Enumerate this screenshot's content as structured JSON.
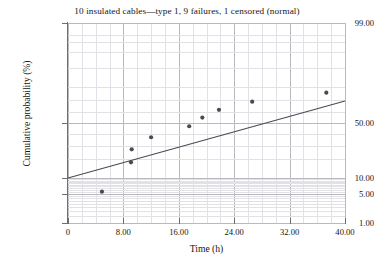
{
  "chart_data": {
    "type": "scatter",
    "title": "10 insulated cables—type 1, 9 failures, 1 censored (normal)",
    "xlabel": "Time (h)",
    "ylabel": "Cumulative probability (%)",
    "xlim": [
      0,
      40
    ],
    "ylim": [
      1,
      99
    ],
    "yscale": "normal-probability",
    "grid": true,
    "legend": "none",
    "xticks": [
      "0",
      "8.00",
      "16.00",
      "24.00",
      "32.00",
      "40.00"
    ],
    "xtick_values": [
      0,
      8,
      16,
      24,
      32,
      40
    ],
    "yticks": [
      "99.00",
      "50.00",
      "10.00",
      "5.00",
      "1.00"
    ],
    "ytick_values": [
      99,
      50,
      10,
      5,
      1
    ],
    "series": [
      {
        "name": "failures",
        "marker": "filled-circle",
        "color": "#4a4a52",
        "points": [
          {
            "x": 4.9,
            "y": 5.5
          },
          {
            "x": 9.1,
            "y": 18.0
          },
          {
            "x": 9.2,
            "y": 27.0
          },
          {
            "x": 12.0,
            "y": 37.0
          },
          {
            "x": 17.5,
            "y": 47.0
          },
          {
            "x": 19.4,
            "y": 55.0
          },
          {
            "x": 21.8,
            "y": 62.0
          },
          {
            "x": 26.6,
            "y": 69.0
          },
          {
            "x": 37.3,
            "y": 76.0
          }
        ]
      },
      {
        "name": "fitted-normal-line",
        "type": "line",
        "color": "#4a4a52",
        "endpoints": [
          {
            "x": 0.0,
            "y": 10.0
          },
          {
            "x": 40.0,
            "y": 69.5
          }
        ]
      }
    ],
    "colors": {
      "marker": "#4a4a52",
      "fit_line": "#4a4a52",
      "major_grid": "#b9b9bd",
      "minor_grid": "#e2e2e6",
      "axis": "#6e6e6e",
      "text": "#141414",
      "background": "#ffffff"
    }
  }
}
